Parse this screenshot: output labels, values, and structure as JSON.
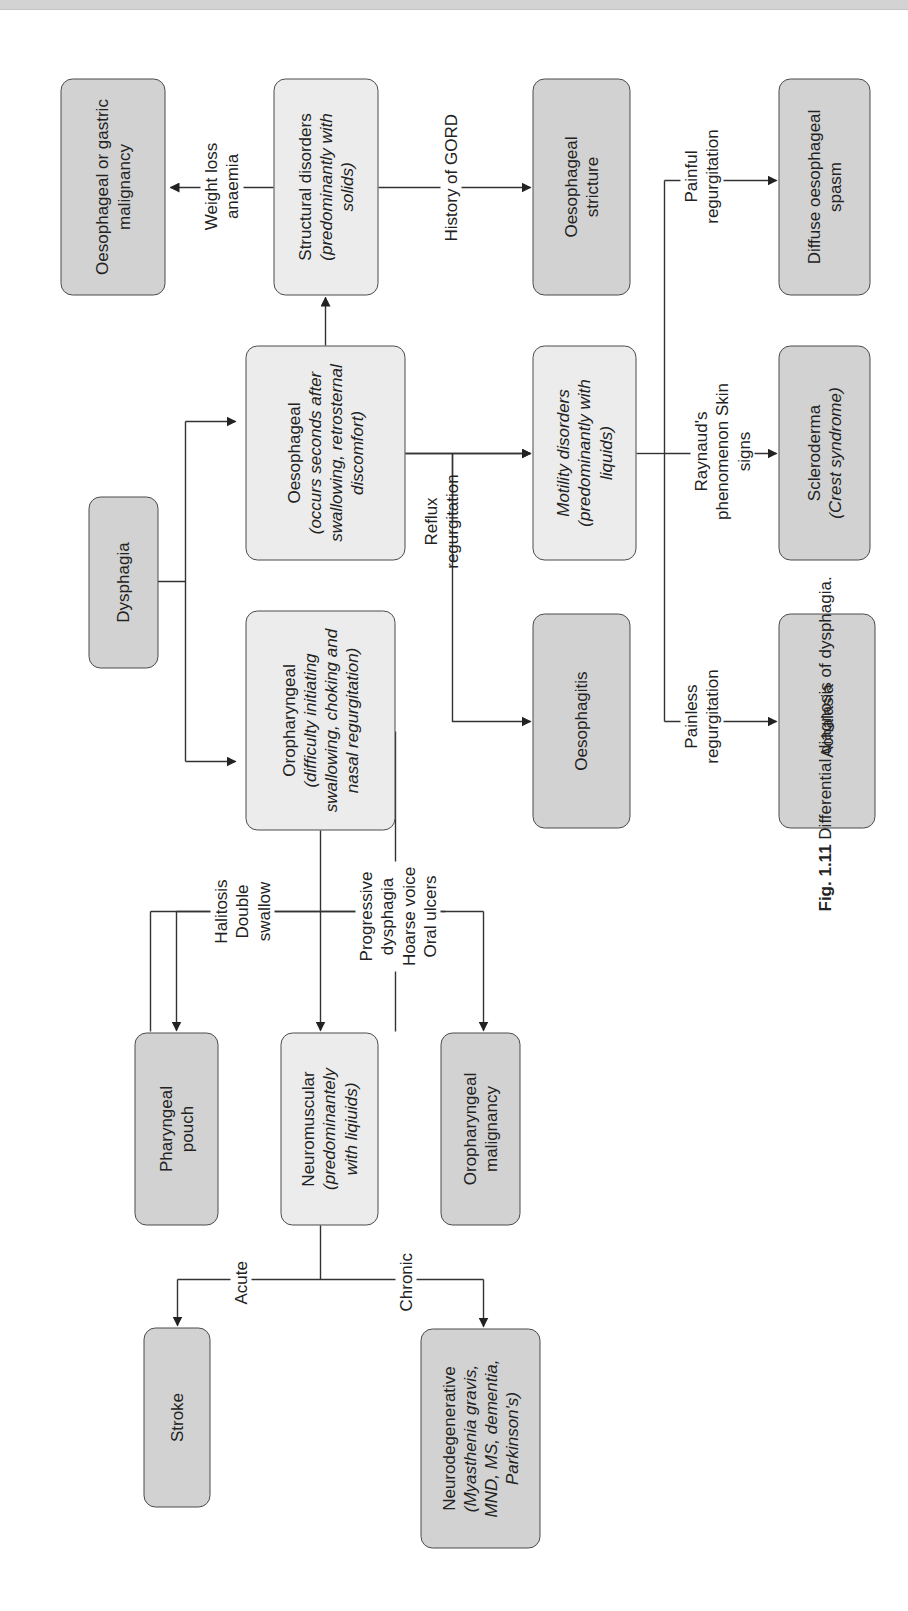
{
  "figure": {
    "caption_number": "Fig. 1.11",
    "caption_text": "Differential diagnosis of dysphagia."
  },
  "nodes": {
    "dysphagia": {
      "title": "Dysphagia"
    },
    "oropharyngeal": {
      "title": "Oropharyngeal",
      "sub": "(difficulty initiating swallowing, choking and nasal regurgitation)"
    },
    "oesophageal": {
      "title": "Oesophageal",
      "sub": "(occurs seconds after swallowing, retrosternal discomfort)"
    },
    "structural": {
      "title": "Structural disorders",
      "sub": "(predominantly with solids)"
    },
    "motility": {
      "title": "",
      "sub": "Motility disorders (predominantly with liquids)"
    },
    "malignancy": {
      "title": "Oesophageal or gastric malignancy"
    },
    "stricture": {
      "title": "Oesophageal stricture"
    },
    "oesophagitis": {
      "title": "Oesophagitis"
    },
    "spasm": {
      "title": "Diffuse oesophageal spasm"
    },
    "scleroderma": {
      "title": "Scleroderma",
      "sub": "(Crest syndrome)"
    },
    "achalasia": {
      "title": "Achalasia"
    },
    "pouch": {
      "title": "Pharyngeal pouch"
    },
    "neuromuscular": {
      "title": "Neuromuscular",
      "sub": "(predominantely with liqiuids)"
    },
    "oro_malignancy": {
      "title": "Oropharyngeal malignancy"
    },
    "stroke": {
      "title": "Stroke"
    },
    "neurodegenerative": {
      "title": "Neurodegenerative",
      "sub": "(Myasthenia gravis, MND, MS, dementia, Parkinson's)"
    }
  },
  "edge_labels": {
    "weight_loss": "Weight loss anaemia",
    "gord": "History of GORD",
    "reflux": "Reflux regurgitation",
    "painful": "Painful regurgitation",
    "raynaud": "Raynaud's phenomenon Skin signs",
    "painless": "Painless regurgitation",
    "halitosis": "Halitosis Double swallow",
    "progressive": "Progressive dysphagia Hoarse voice Oral ulcers",
    "acute": "Acute",
    "chronic": "Chronic"
  },
  "colors": {
    "dark_box": "#d2d2d2",
    "light_box": "#ececec",
    "line": "#333333"
  }
}
